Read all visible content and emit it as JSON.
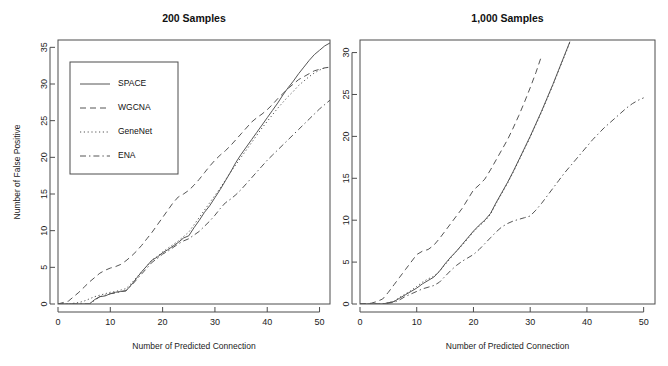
{
  "figure": {
    "width": 668,
    "height": 366,
    "background": "#ffffff",
    "line_color": "#555555",
    "axis_color": "#4d4d4d"
  },
  "chart_data": [
    {
      "type": "line",
      "title": "200 Samples",
      "xlabel": "Number of Predicted Connection",
      "ylabel": "Number of False Positive",
      "xlim": [
        0,
        52
      ],
      "ylim": [
        0,
        36
      ],
      "xticks": [
        0,
        10,
        20,
        30,
        40,
        50
      ],
      "yticks": [
        0,
        5,
        10,
        15,
        20,
        25,
        30,
        35
      ],
      "grid": false,
      "legend_position": "top-left",
      "series": [
        {
          "name": "SPACE",
          "style": "solid",
          "x": [
            0,
            2,
            4,
            5,
            6,
            7,
            8,
            9,
            10,
            11,
            12,
            13,
            14,
            15,
            16,
            17,
            18,
            19,
            20,
            21,
            22,
            23,
            24,
            25,
            26,
            27,
            28,
            29,
            30,
            31,
            32,
            33,
            34,
            35,
            36,
            37,
            38,
            39,
            40,
            41,
            42,
            43,
            44,
            45,
            46,
            47,
            48,
            49,
            50,
            51,
            52
          ],
          "y": [
            0,
            0,
            0,
            0,
            0,
            0.6,
            1,
            1.1,
            1.4,
            1.6,
            1.7,
            1.8,
            2.6,
            3.5,
            4.4,
            5.2,
            6,
            6.4,
            7,
            7.4,
            7.9,
            8.4,
            9,
            9.3,
            10.4,
            11.4,
            12.5,
            13.4,
            14.5,
            15.6,
            16.8,
            18,
            19.3,
            20.4,
            21.4,
            22.4,
            23.4,
            24.4,
            25.4,
            26.4,
            27.4,
            28.5,
            29.5,
            30.4,
            31.4,
            32.3,
            33.2,
            34,
            34.6,
            35.2,
            35.6
          ]
        },
        {
          "name": "WGCNA",
          "style": "dashed",
          "x": [
            0,
            1,
            2,
            3,
            4,
            5,
            6,
            7,
            8,
            9,
            10,
            11,
            12,
            13,
            14,
            15,
            16,
            17,
            18,
            19,
            20,
            21,
            22,
            23,
            24,
            25,
            26,
            27,
            28,
            29,
            30,
            31,
            32,
            33,
            34,
            35,
            36,
            37,
            38,
            39,
            40,
            41,
            42,
            43,
            44,
            45,
            46,
            47,
            48,
            49,
            50,
            51,
            52
          ],
          "y": [
            0,
            0.2,
            0.4,
            1.0,
            1.6,
            2.3,
            3.0,
            3.6,
            4.2,
            4.6,
            4.9,
            5.1,
            5.4,
            5.9,
            6.5,
            7.2,
            8.0,
            8.9,
            9.8,
            10.8,
            11.8,
            12.8,
            13.8,
            14.6,
            15.0,
            15.5,
            16.2,
            17.0,
            17.9,
            18.8,
            19.6,
            20.3,
            20.9,
            21.6,
            22.4,
            23.2,
            24.0,
            24.8,
            25.4,
            25.9,
            26.5,
            27.2,
            28.0,
            28.7,
            29.4,
            30.0,
            30.6,
            31.0,
            31.4,
            31.8,
            32.0,
            32.2,
            32.3
          ]
        },
        {
          "name": "GeneNet",
          "style": "dotted",
          "x": [
            0,
            2,
            4,
            5,
            6,
            7,
            8,
            9,
            10,
            11,
            12,
            13,
            14,
            15,
            16,
            17,
            18,
            19,
            20,
            21,
            22,
            23,
            24,
            25,
            26,
            27,
            28,
            29,
            30,
            31,
            32,
            33,
            34,
            35,
            36,
            37,
            38,
            39,
            40,
            41,
            42,
            43,
            44,
            45,
            46,
            47,
            48,
            49,
            50,
            51,
            52
          ],
          "y": [
            0,
            0,
            0.2,
            0.4,
            0.7,
            1.0,
            1.2,
            1.4,
            1.6,
            1.7,
            1.9,
            2.1,
            2.8,
            3.6,
            4.4,
            5.2,
            6.0,
            6.5,
            7.1,
            7.6,
            8.1,
            8.6,
            9.2,
            9.8,
            10.8,
            11.8,
            12.8,
            13.8,
            14.8,
            15.8,
            16.9,
            18.0,
            19.0,
            20.0,
            21.0,
            22.0,
            23.0,
            24.0,
            24.9,
            25.8,
            26.7,
            27.5,
            28.3,
            29.0,
            29.8,
            30.4,
            31.0,
            31.5,
            31.9,
            32.2,
            32.3
          ]
        },
        {
          "name": "ENA",
          "style": "dashdot",
          "x": [
            0,
            2,
            4,
            5,
            6,
            7,
            8,
            9,
            10,
            11,
            12,
            13,
            14,
            15,
            16,
            17,
            18,
            19,
            20,
            21,
            22,
            23,
            24,
            25,
            26,
            27,
            28,
            29,
            30,
            31,
            32,
            33,
            34,
            35,
            36,
            37,
            38,
            39,
            40,
            41,
            42,
            43,
            44,
            45,
            46,
            47,
            48,
            49,
            50,
            51,
            52
          ],
          "y": [
            0,
            0,
            0,
            0,
            0,
            0.5,
            1.0,
            1.2,
            1.4,
            1.5,
            1.7,
            1.8,
            2.5,
            3.3,
            4.1,
            4.9,
            5.7,
            6.2,
            6.8,
            7.2,
            7.7,
            8.2,
            8.6,
            8.9,
            9.4,
            9.9,
            10.6,
            11.3,
            12.1,
            13.0,
            13.8,
            14.3,
            14.9,
            15.6,
            16.4,
            17.2,
            18.0,
            18.8,
            19.6,
            20.3,
            21.0,
            21.7,
            22.4,
            23.1,
            23.8,
            24.5,
            25.2,
            25.9,
            26.6,
            27.2,
            27.8
          ]
        }
      ],
      "legend": [
        {
          "label": "SPACE",
          "style": "solid"
        },
        {
          "label": "WGCNA",
          "style": "dashed"
        },
        {
          "label": "GeneNet",
          "style": "dotted"
        },
        {
          "label": "ENA",
          "style": "dashdot"
        }
      ]
    },
    {
      "type": "line",
      "title": "1,000 Samples",
      "xlabel": "Number of Predicted Connection",
      "ylabel": "",
      "xlim": [
        0,
        52
      ],
      "ylim": [
        0,
        31.5
      ],
      "xticks": [
        0,
        10,
        20,
        30,
        40,
        50
      ],
      "yticks": [
        0,
        5,
        10,
        15,
        20,
        25,
        30
      ],
      "grid": false,
      "legend_position": "none",
      "series": [
        {
          "name": "SPACE",
          "style": "solid",
          "x": [
            0,
            2,
            4,
            6,
            7,
            8,
            9,
            10,
            11,
            12,
            13,
            14,
            15,
            16,
            17,
            18,
            19,
            20,
            21,
            22,
            23,
            24,
            25,
            26,
            27,
            28,
            29,
            30,
            31,
            32,
            33,
            34,
            35,
            36,
            37
          ],
          "y": [
            0,
            0,
            0,
            0.3,
            0.7,
            1.1,
            1.5,
            1.9,
            2.4,
            2.8,
            3.2,
            3.9,
            4.8,
            5.6,
            6.3,
            7.1,
            7.9,
            8.7,
            9.4,
            10.0,
            10.8,
            12.1,
            13.3,
            14.5,
            15.8,
            17.2,
            18.6,
            20.0,
            21.5,
            23.0,
            24.6,
            26.2,
            27.9,
            29.6,
            31.3
          ]
        },
        {
          "name": "WGCNA",
          "style": "dashed",
          "x": [
            0,
            1,
            2,
            3,
            4,
            5,
            6,
            7,
            8,
            9,
            10,
            11,
            12,
            13,
            14,
            15,
            16,
            17,
            18,
            19,
            20,
            21,
            22,
            23,
            24,
            25,
            26,
            27,
            28,
            29,
            30,
            31,
            32
          ],
          "y": [
            0,
            0,
            0.1,
            0.3,
            0.6,
            1.4,
            2.3,
            3.2,
            4.1,
            5.0,
            5.9,
            6.3,
            6.5,
            7.0,
            7.8,
            8.7,
            9.6,
            10.5,
            11.4,
            12.5,
            13.6,
            14.2,
            14.9,
            16.0,
            17.2,
            18.4,
            19.6,
            21.0,
            22.5,
            24.1,
            25.8,
            27.6,
            29.6
          ]
        },
        {
          "name": "GeneNet",
          "style": "dotted",
          "x": [
            0,
            2,
            4,
            6,
            7,
            8,
            9,
            10,
            11,
            12,
            13,
            14,
            15,
            16,
            17,
            18,
            19,
            20,
            21,
            22,
            23,
            24,
            25,
            26,
            27,
            28,
            29,
            30,
            31,
            32,
            33,
            34,
            35,
            36,
            37
          ],
          "y": [
            0,
            0,
            0,
            0.3,
            0.8,
            1.2,
            1.6,
            2.1,
            2.6,
            3.0,
            3.3,
            3.9,
            4.7,
            5.5,
            6.3,
            7.0,
            7.8,
            8.6,
            9.3,
            9.9,
            10.7,
            12.0,
            13.2,
            14.4,
            15.7,
            17.1,
            18.5,
            19.9,
            21.4,
            22.9,
            24.5,
            26.1,
            27.8,
            29.5,
            31.2
          ]
        },
        {
          "name": "ENA",
          "style": "dashdot",
          "x": [
            0,
            2,
            4,
            6,
            7,
            8,
            9,
            10,
            11,
            12,
            13,
            14,
            15,
            16,
            17,
            18,
            19,
            20,
            21,
            22,
            23,
            24,
            25,
            26,
            27,
            28,
            29,
            30,
            31,
            32,
            33,
            34,
            35,
            36,
            37,
            38,
            39,
            40,
            41,
            42,
            43,
            44,
            45,
            46,
            47,
            48,
            49,
            50
          ],
          "y": [
            0,
            0,
            0,
            0.2,
            0.5,
            0.9,
            1.2,
            1.5,
            1.8,
            2.0,
            2.2,
            2.6,
            3.3,
            4.0,
            4.6,
            5.1,
            5.5,
            5.9,
            6.5,
            7.2,
            7.9,
            8.6,
            9.2,
            9.6,
            9.9,
            10.1,
            10.3,
            10.5,
            11.2,
            12.0,
            12.9,
            13.8,
            14.7,
            15.6,
            16.4,
            17.2,
            18.0,
            18.8,
            19.6,
            20.3,
            21.0,
            21.6,
            22.2,
            22.8,
            23.4,
            23.9,
            24.3,
            24.6
          ]
        }
      ],
      "legend": []
    }
  ]
}
